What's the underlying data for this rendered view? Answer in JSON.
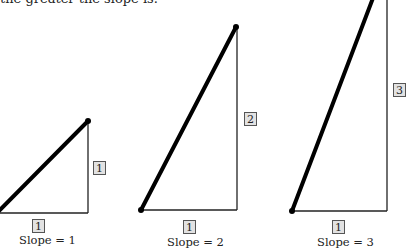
{
  "intro_text": "the greater the slope is.",
  "triangles": [
    {
      "run_label": "1",
      "rise_label": "1",
      "caption": "Slope = 1",
      "slope": 1
    },
    {
      "run_label": "1",
      "rise_label": "2",
      "caption": "Slope = 2",
      "slope": 2
    },
    {
      "run_label": "1",
      "rise_label": "3",
      "caption": "Slope = 3",
      "slope": 3
    }
  ],
  "colors": {
    "line": "#000000",
    "label_fill": "#e2e2e2",
    "label_border": "#555555"
  }
}
